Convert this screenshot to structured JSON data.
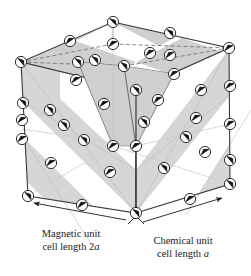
{
  "figure": {
    "type": "crystal-structure-diagram",
    "projection": "oblique-isometric",
    "colors": {
      "band_fill": "#d6d6d6",
      "band_fill_top": "#cfcfcf",
      "line": "#3a3a3a",
      "line_light": "#9a9a9a",
      "atom_fill": "#ffffff",
      "atom_stroke": "#1a1a1a",
      "spin_color": "#111111",
      "background": "#ffffff",
      "text": "#1a1a1a"
    },
    "atom_count": 40,
    "atom_radius": 5.6,
    "legend_note": "Circles are magnetic ions; the internal arrow shows the spin direction."
  },
  "captions": {
    "magnetic": {
      "line1": "Magnetic unit",
      "line2_prefix": "cell length 2",
      "line2_symbol": "a"
    },
    "chemical": {
      "line1": "Chemical unit",
      "line2_prefix": "cell length ",
      "line2_symbol": "a"
    }
  },
  "dimensions": {
    "magnetic_cell_length": "2a",
    "chemical_cell_length": "a"
  },
  "geometry": {
    "vertices": {
      "top_back": [
        113,
        22
      ],
      "top_left": [
        21,
        62
      ],
      "top_right": [
        229,
        48
      ],
      "top_front": [
        136,
        90
      ],
      "bot_left": [
        28,
        196
      ],
      "bot_front": [
        136,
        213
      ],
      "bot_right": [
        230,
        184
      ],
      "bot_back": [
        113,
        146
      ]
    }
  },
  "atoms": [
    {
      "id": "a01",
      "x": 113,
      "y": 22,
      "spin": 135
    },
    {
      "id": "a02",
      "x": 70,
      "y": 41,
      "spin": 55
    },
    {
      "id": "a03",
      "x": 170,
      "y": 33,
      "spin": 140
    },
    {
      "id": "a04",
      "x": 21,
      "y": 62,
      "spin": 140
    },
    {
      "id": "a05",
      "x": 113,
      "y": 44,
      "spin": 58
    },
    {
      "id": "a06",
      "x": 78,
      "y": 62,
      "spin": 140
    },
    {
      "id": "a07",
      "x": 170,
      "y": 55,
      "spin": 55
    },
    {
      "id": "a08",
      "x": 229,
      "y": 48,
      "spin": 58
    },
    {
      "id": "a09",
      "x": 124,
      "y": 66,
      "spin": 140
    },
    {
      "id": "a10",
      "x": 76,
      "y": 80,
      "spin": 58
    },
    {
      "id": "a11",
      "x": 174,
      "y": 74,
      "spin": 58
    },
    {
      "id": "a12",
      "x": 136,
      "y": 90,
      "spin": 140
    },
    {
      "id": "a13",
      "x": 23,
      "y": 103,
      "spin": 140
    },
    {
      "id": "a14",
      "x": 50,
      "y": 110,
      "spin": 140
    },
    {
      "id": "a15",
      "x": 104,
      "y": 104,
      "spin": 58
    },
    {
      "id": "a16",
      "x": 158,
      "y": 100,
      "spin": 55
    },
    {
      "id": "a17",
      "x": 201,
      "y": 90,
      "spin": 55
    },
    {
      "id": "a18",
      "x": 230,
      "y": 86,
      "spin": 58
    },
    {
      "id": "a19",
      "x": 22,
      "y": 139,
      "spin": 58
    },
    {
      "id": "a20",
      "x": 84,
      "y": 140,
      "spin": 140
    },
    {
      "id": "a21",
      "x": 136,
      "y": 146,
      "spin": 58
    },
    {
      "id": "a22",
      "x": 186,
      "y": 137,
      "spin": 140
    },
    {
      "id": "a23",
      "x": 230,
      "y": 124,
      "spin": 55
    },
    {
      "id": "a24",
      "x": 51,
      "y": 163,
      "spin": 58
    },
    {
      "id": "a25",
      "x": 110,
      "y": 172,
      "spin": 58
    },
    {
      "id": "a26",
      "x": 164,
      "y": 168,
      "spin": 140
    },
    {
      "id": "a27",
      "x": 205,
      "y": 152,
      "spin": 55
    },
    {
      "id": "a28",
      "x": 28,
      "y": 196,
      "spin": 140
    },
    {
      "id": "a29",
      "x": 82,
      "y": 205,
      "spin": 58
    },
    {
      "id": "a30",
      "x": 136,
      "y": 213,
      "spin": 140
    },
    {
      "id": "a31",
      "x": 190,
      "y": 199,
      "spin": 58
    },
    {
      "id": "a32",
      "x": 230,
      "y": 184,
      "spin": 140
    },
    {
      "id": "a33",
      "x": 230,
      "y": 160,
      "spin": 140
    },
    {
      "id": "a34",
      "x": 22,
      "y": 120,
      "spin": 58
    },
    {
      "id": "a35",
      "x": 113,
      "y": 146,
      "spin": 58
    },
    {
      "id": "a36",
      "x": 64,
      "y": 125,
      "spin": 140
    },
    {
      "id": "a37",
      "x": 196,
      "y": 118,
      "spin": 58
    },
    {
      "id": "a38",
      "x": 144,
      "y": 122,
      "spin": 140
    },
    {
      "id": "a39",
      "x": 95,
      "y": 60,
      "spin": 140
    },
    {
      "id": "a40",
      "x": 150,
      "y": 53,
      "spin": 58
    }
  ]
}
